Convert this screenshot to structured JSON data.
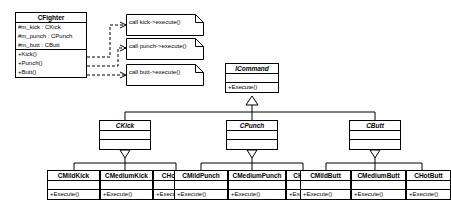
{
  "diagram": {
    "stroke_color": "#000000",
    "background_color": "#ffffff"
  },
  "classes": {
    "fighter": {
      "name": "CFighter",
      "attributes": [
        "#m_kick : CKick",
        "#m_punch : CPunch",
        "#m_butt : CButt"
      ],
      "operations": [
        "+Kick()",
        "+Punch()",
        "+Butt()"
      ]
    },
    "command": {
      "name": "ICommand",
      "attributes": [],
      "operations": [
        "+Execute()"
      ]
    },
    "kick": {
      "name": "CKick",
      "attributes": [],
      "operations": []
    },
    "punch": {
      "name": "CPunch",
      "attributes": [],
      "operations": []
    },
    "butt": {
      "name": "CButt",
      "attributes": [],
      "operations": []
    },
    "mild_kick": {
      "name": "CMildKick",
      "operations": [
        "+Execute()"
      ]
    },
    "medium_kick": {
      "name": "CMediumKick",
      "operations": [
        "+Execute()"
      ]
    },
    "hot_kick": {
      "name": "CHotKick",
      "operations": [
        "+Execute()"
      ]
    },
    "mild_punch": {
      "name": "CMildPunch",
      "operations": [
        "+Execute()"
      ]
    },
    "medium_punch": {
      "name": "CMediumPunch",
      "operations": [
        "+Execute()"
      ]
    },
    "hot_punch": {
      "name": "CHotPunch",
      "operations": [
        "+Execute()"
      ]
    },
    "mild_butt": {
      "name": "CMildButt",
      "operations": [
        "+Execute()"
      ]
    },
    "medium_butt": {
      "name": "CMediumButt",
      "operations": [
        "+Execute()"
      ]
    },
    "hot_butt": {
      "name": "CHotButt",
      "operations": [
        "+Execute()"
      ]
    }
  },
  "notes": {
    "kick_note": {
      "text": "call kick->execute()"
    },
    "punch_note": {
      "text": "call punch->execute()"
    },
    "butt_note": {
      "text": "call butt->execute()"
    }
  }
}
